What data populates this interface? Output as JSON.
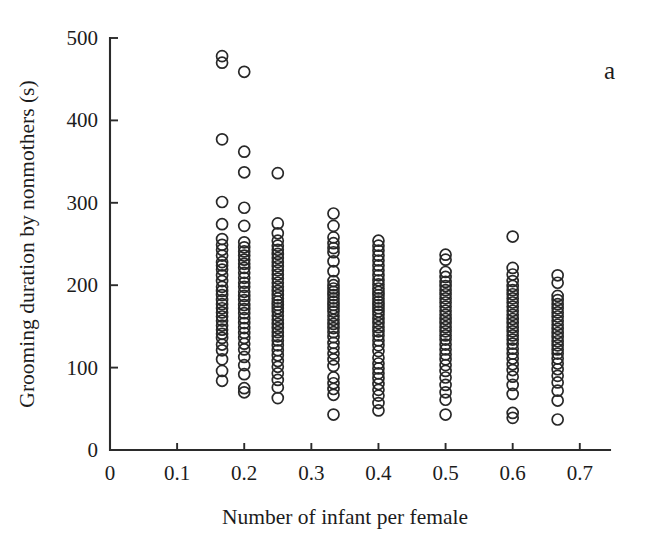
{
  "panel": {
    "label": "a"
  },
  "chart_data": {
    "type": "scatter",
    "title": "",
    "subtitle": "",
    "xlabel": "Number of infant per female",
    "ylabel": "Grooming duration by nonmothers (s)",
    "xlim": [
      0,
      0.745
    ],
    "ylim": [
      0,
      500
    ],
    "xticks": [
      0,
      0.1,
      0.2,
      0.3,
      0.4,
      0.5,
      0.6,
      0.7
    ],
    "xtick_labels": [
      "0",
      "0.1",
      "0.2",
      "0.3",
      "0.4",
      "0.5",
      "0.6",
      "0.7"
    ],
    "yticks": [
      0,
      100,
      200,
      300,
      400,
      500
    ],
    "ytick_labels": [
      "0",
      "100",
      "200",
      "300",
      "400",
      "500"
    ],
    "grid": false,
    "legend": null,
    "marker": "open-circle",
    "marker_color": "#282828",
    "marker_size": 11,
    "annotations": [
      {
        "text": "a",
        "x": 0.69,
        "y": 468
      }
    ],
    "series": [
      {
        "name": "Grooming duration by nonmothers",
        "points": [
          [
            0.167,
            478
          ],
          [
            0.167,
            470
          ],
          [
            0.167,
            377
          ],
          [
            0.167,
            301
          ],
          [
            0.167,
            274
          ],
          [
            0.167,
            256
          ],
          [
            0.167,
            249
          ],
          [
            0.167,
            243
          ],
          [
            0.167,
            236
          ],
          [
            0.167,
            228
          ],
          [
            0.167,
            224
          ],
          [
            0.167,
            219
          ],
          [
            0.167,
            212
          ],
          [
            0.167,
            205
          ],
          [
            0.167,
            198
          ],
          [
            0.167,
            193
          ],
          [
            0.167,
            188
          ],
          [
            0.167,
            182
          ],
          [
            0.167,
            177
          ],
          [
            0.167,
            172
          ],
          [
            0.167,
            167
          ],
          [
            0.167,
            162
          ],
          [
            0.167,
            157
          ],
          [
            0.167,
            151
          ],
          [
            0.167,
            146
          ],
          [
            0.167,
            141
          ],
          [
            0.167,
            136
          ],
          [
            0.167,
            128
          ],
          [
            0.167,
            121
          ],
          [
            0.167,
            110
          ],
          [
            0.167,
            96
          ],
          [
            0.167,
            84
          ],
          [
            0.2,
            459
          ],
          [
            0.2,
            362
          ],
          [
            0.2,
            337
          ],
          [
            0.2,
            294
          ],
          [
            0.2,
            272
          ],
          [
            0.2,
            252
          ],
          [
            0.2,
            246
          ],
          [
            0.2,
            241
          ],
          [
            0.2,
            236
          ],
          [
            0.2,
            231
          ],
          [
            0.2,
            226
          ],
          [
            0.2,
            221
          ],
          [
            0.2,
            215
          ],
          [
            0.2,
            209
          ],
          [
            0.2,
            203
          ],
          [
            0.2,
            198
          ],
          [
            0.2,
            192
          ],
          [
            0.2,
            187
          ],
          [
            0.2,
            182
          ],
          [
            0.2,
            176
          ],
          [
            0.2,
            171
          ],
          [
            0.2,
            166
          ],
          [
            0.2,
            160
          ],
          [
            0.2,
            154
          ],
          [
            0.2,
            148
          ],
          [
            0.2,
            142
          ],
          [
            0.2,
            136
          ],
          [
            0.2,
            129
          ],
          [
            0.2,
            122
          ],
          [
            0.2,
            113
          ],
          [
            0.2,
            103
          ],
          [
            0.2,
            92
          ],
          [
            0.2,
            75
          ],
          [
            0.2,
            70
          ],
          [
            0.25,
            336
          ],
          [
            0.25,
            275
          ],
          [
            0.25,
            263
          ],
          [
            0.25,
            254
          ],
          [
            0.25,
            248
          ],
          [
            0.25,
            243
          ],
          [
            0.25,
            238
          ],
          [
            0.25,
            233
          ],
          [
            0.25,
            228
          ],
          [
            0.25,
            223
          ],
          [
            0.25,
            218
          ],
          [
            0.25,
            213
          ],
          [
            0.25,
            208
          ],
          [
            0.25,
            203
          ],
          [
            0.25,
            198
          ],
          [
            0.25,
            193
          ],
          [
            0.25,
            188
          ],
          [
            0.25,
            184
          ],
          [
            0.25,
            180
          ],
          [
            0.25,
            176
          ],
          [
            0.25,
            172
          ],
          [
            0.25,
            168
          ],
          [
            0.25,
            163
          ],
          [
            0.25,
            158
          ],
          [
            0.25,
            153
          ],
          [
            0.25,
            148
          ],
          [
            0.25,
            143
          ],
          [
            0.25,
            138
          ],
          [
            0.25,
            133
          ],
          [
            0.25,
            127
          ],
          [
            0.25,
            121
          ],
          [
            0.25,
            115
          ],
          [
            0.25,
            108
          ],
          [
            0.25,
            101
          ],
          [
            0.25,
            93
          ],
          [
            0.25,
            85
          ],
          [
            0.25,
            76
          ],
          [
            0.25,
            63
          ],
          [
            0.333,
            287
          ],
          [
            0.333,
            272
          ],
          [
            0.333,
            258
          ],
          [
            0.333,
            251
          ],
          [
            0.333,
            245
          ],
          [
            0.333,
            240
          ],
          [
            0.333,
            229
          ],
          [
            0.333,
            217
          ],
          [
            0.333,
            205
          ],
          [
            0.333,
            200
          ],
          [
            0.333,
            196
          ],
          [
            0.333,
            192
          ],
          [
            0.333,
            188
          ],
          [
            0.333,
            184
          ],
          [
            0.333,
            180
          ],
          [
            0.333,
            176
          ],
          [
            0.333,
            172
          ],
          [
            0.333,
            168
          ],
          [
            0.333,
            163
          ],
          [
            0.333,
            158
          ],
          [
            0.333,
            153
          ],
          [
            0.333,
            148
          ],
          [
            0.333,
            143
          ],
          [
            0.333,
            137
          ],
          [
            0.333,
            130
          ],
          [
            0.333,
            124
          ],
          [
            0.333,
            117
          ],
          [
            0.333,
            110
          ],
          [
            0.333,
            102
          ],
          [
            0.333,
            88
          ],
          [
            0.333,
            81
          ],
          [
            0.333,
            74
          ],
          [
            0.333,
            67
          ],
          [
            0.333,
            43
          ],
          [
            0.4,
            254
          ],
          [
            0.4,
            248
          ],
          [
            0.4,
            242
          ],
          [
            0.4,
            236
          ],
          [
            0.4,
            230
          ],
          [
            0.4,
            224
          ],
          [
            0.4,
            218
          ],
          [
            0.4,
            212
          ],
          [
            0.4,
            206
          ],
          [
            0.4,
            201
          ],
          [
            0.4,
            196
          ],
          [
            0.4,
            192
          ],
          [
            0.4,
            188
          ],
          [
            0.4,
            184
          ],
          [
            0.4,
            180
          ],
          [
            0.4,
            176
          ],
          [
            0.4,
            172
          ],
          [
            0.4,
            168
          ],
          [
            0.4,
            164
          ],
          [
            0.4,
            159
          ],
          [
            0.4,
            154
          ],
          [
            0.4,
            149
          ],
          [
            0.4,
            144
          ],
          [
            0.4,
            139
          ],
          [
            0.4,
            133
          ],
          [
            0.4,
            127
          ],
          [
            0.4,
            120
          ],
          [
            0.4,
            112
          ],
          [
            0.4,
            105
          ],
          [
            0.4,
            99
          ],
          [
            0.4,
            93
          ],
          [
            0.4,
            87
          ],
          [
            0.4,
            80
          ],
          [
            0.4,
            73
          ],
          [
            0.4,
            66
          ],
          [
            0.4,
            57
          ],
          [
            0.4,
            48
          ],
          [
            0.5,
            237
          ],
          [
            0.5,
            231
          ],
          [
            0.5,
            216
          ],
          [
            0.5,
            210
          ],
          [
            0.5,
            204
          ],
          [
            0.5,
            199
          ],
          [
            0.5,
            194
          ],
          [
            0.5,
            189
          ],
          [
            0.5,
            184
          ],
          [
            0.5,
            179
          ],
          [
            0.5,
            174
          ],
          [
            0.5,
            169
          ],
          [
            0.5,
            164
          ],
          [
            0.5,
            159
          ],
          [
            0.5,
            154
          ],
          [
            0.5,
            149
          ],
          [
            0.5,
            144
          ],
          [
            0.5,
            139
          ],
          [
            0.5,
            134
          ],
          [
            0.5,
            128
          ],
          [
            0.5,
            122
          ],
          [
            0.5,
            116
          ],
          [
            0.5,
            110
          ],
          [
            0.5,
            103
          ],
          [
            0.5,
            96
          ],
          [
            0.5,
            88
          ],
          [
            0.5,
            79
          ],
          [
            0.5,
            70
          ],
          [
            0.5,
            61
          ],
          [
            0.5,
            43
          ],
          [
            0.6,
            259
          ],
          [
            0.6,
            221
          ],
          [
            0.6,
            213
          ],
          [
            0.6,
            205
          ],
          [
            0.6,
            199
          ],
          [
            0.6,
            194
          ],
          [
            0.6,
            189
          ],
          [
            0.6,
            184
          ],
          [
            0.6,
            179
          ],
          [
            0.6,
            174
          ],
          [
            0.6,
            169
          ],
          [
            0.6,
            164
          ],
          [
            0.6,
            159
          ],
          [
            0.6,
            154
          ],
          [
            0.6,
            149
          ],
          [
            0.6,
            144
          ],
          [
            0.6,
            139
          ],
          [
            0.6,
            134
          ],
          [
            0.6,
            129
          ],
          [
            0.6,
            123
          ],
          [
            0.6,
            117
          ],
          [
            0.6,
            111
          ],
          [
            0.6,
            104
          ],
          [
            0.6,
            97
          ],
          [
            0.6,
            89
          ],
          [
            0.6,
            79
          ],
          [
            0.6,
            68
          ],
          [
            0.6,
            45
          ],
          [
            0.6,
            39
          ],
          [
            0.667,
            212
          ],
          [
            0.667,
            203
          ],
          [
            0.667,
            187
          ],
          [
            0.667,
            182
          ],
          [
            0.667,
            177
          ],
          [
            0.667,
            172
          ],
          [
            0.667,
            167
          ],
          [
            0.667,
            162
          ],
          [
            0.667,
            157
          ],
          [
            0.667,
            152
          ],
          [
            0.667,
            147
          ],
          [
            0.667,
            142
          ],
          [
            0.667,
            137
          ],
          [
            0.667,
            132
          ],
          [
            0.667,
            127
          ],
          [
            0.667,
            122
          ],
          [
            0.667,
            117
          ],
          [
            0.667,
            111
          ],
          [
            0.667,
            105
          ],
          [
            0.667,
            98
          ],
          [
            0.667,
            90
          ],
          [
            0.667,
            82
          ],
          [
            0.667,
            72
          ],
          [
            0.667,
            60
          ],
          [
            0.667,
            37
          ]
        ]
      }
    ]
  }
}
